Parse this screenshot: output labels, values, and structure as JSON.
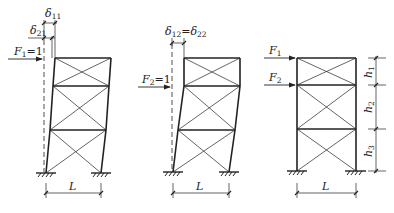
{
  "diagram": {
    "stroke_color": "#222222",
    "frames": [
      {
        "id": "frame-1",
        "force_label": "F",
        "force_sub": "1",
        "force_value": "=1",
        "delta_top_label": "δ",
        "delta_top_sub": "11",
        "delta_mid_label": "δ",
        "delta_mid_sub": "21",
        "span_label": "L"
      },
      {
        "id": "frame-2",
        "force_label": "F",
        "force_sub": "2",
        "force_value": "=1",
        "delta_label_a": "δ",
        "delta_sub_a": "12",
        "delta_eq": "=",
        "delta_label_b": "δ",
        "delta_sub_b": "22",
        "span_label": "L"
      },
      {
        "id": "frame-3",
        "force1_label": "F",
        "force1_sub": "1",
        "force2_label": "F",
        "force2_sub": "2",
        "h1_label": "h",
        "h1_sub": "1",
        "h2_label": "h",
        "h2_sub": "2",
        "h3_label": "h",
        "h3_sub": "3",
        "span_label": "L"
      }
    ]
  }
}
